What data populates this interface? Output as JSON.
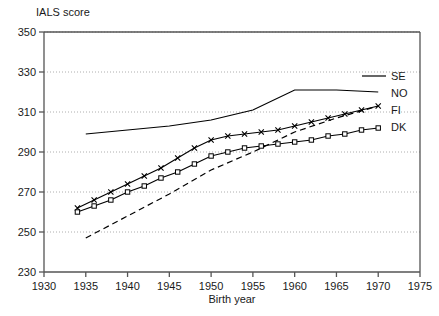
{
  "chart_data": {
    "type": "line",
    "title": "",
    "ylabel": "IALS score",
    "xlabel": "Birth year",
    "xlim": [
      1930,
      1975
    ],
    "ylim": [
      230,
      350
    ],
    "xticks": [
      1930,
      1935,
      1940,
      1945,
      1950,
      1955,
      1960,
      1965,
      1970,
      1975
    ],
    "yticks": [
      230,
      250,
      270,
      290,
      310,
      330,
      350
    ],
    "grid": "horizontal-dotted",
    "legend_position": "right-inside",
    "series": [
      {
        "name": "SE",
        "style": "solid",
        "marker": "none",
        "x": [
          1935,
          1940,
          1945,
          1950,
          1955,
          1960,
          1965,
          1970
        ],
        "values": [
          299,
          301,
          303,
          306,
          311,
          321,
          321,
          320
        ]
      },
      {
        "name": "NO",
        "style": "dashed",
        "marker": "none",
        "x": [
          1935,
          1940,
          1945,
          1950,
          1955,
          1960,
          1965,
          1970
        ],
        "values": [
          247,
          258,
          269,
          281,
          290,
          300,
          307,
          313
        ]
      },
      {
        "name": "FI",
        "style": "solid",
        "marker": "cross",
        "x": [
          1934,
          1936,
          1938,
          1940,
          1942,
          1944,
          1946,
          1948,
          1950,
          1952,
          1954,
          1956,
          1958,
          1960,
          1962,
          1964,
          1966,
          1968,
          1970
        ],
        "values": [
          262,
          266,
          270,
          274,
          278,
          282,
          287,
          292,
          296,
          298,
          299,
          300,
          301,
          303,
          305,
          307,
          309,
          311,
          313
        ]
      },
      {
        "name": "DK",
        "style": "solid",
        "marker": "square",
        "x": [
          1934,
          1936,
          1938,
          1940,
          1942,
          1944,
          1946,
          1948,
          1950,
          1952,
          1954,
          1956,
          1958,
          1960,
          1962,
          1964,
          1966,
          1968,
          1970
        ],
        "values": [
          260,
          263,
          266,
          270,
          273,
          277,
          280,
          284,
          288,
          290,
          292,
          293,
          294,
          295,
          296,
          298,
          299,
          301,
          302
        ]
      }
    ],
    "legend_entries": [
      "SE",
      "NO",
      "FI",
      "DK"
    ]
  }
}
